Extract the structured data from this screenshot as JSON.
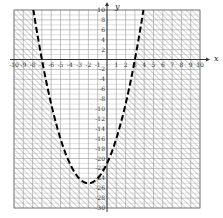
{
  "chart_data": {
    "type": "line",
    "title": "",
    "xlabel": "x",
    "ylabel": "y",
    "xlim": [
      -10,
      10
    ],
    "ylim": [
      -30,
      10
    ],
    "x_step": 1,
    "y_step": 2,
    "grid": true,
    "x_tick_labels": [
      "-10",
      "-9",
      "-8",
      "-7",
      "-6",
      "-5",
      "-4",
      "-3",
      "-2",
      "-1",
      "1",
      "2",
      "3",
      "4",
      "5",
      "6",
      "7",
      "8",
      "9",
      "10"
    ],
    "y_tick_labels": [
      "10",
      "8",
      "6",
      "4",
      "2",
      "-2",
      "-4",
      "-6",
      "-8",
      "-10",
      "-12",
      "-14",
      "-16",
      "-18",
      "-20",
      "-22",
      "-24",
      "-26",
      "-28",
      "-30"
    ],
    "series": [
      {
        "name": "boundary",
        "equation": "y = x^2 + 4x - 21",
        "style": "dashed",
        "color": "#000000",
        "vertex": [
          -2,
          -25
        ],
        "roots": [
          -7,
          3
        ],
        "y_intercept": -21
      }
    ],
    "shaded_region": "outside parabola (y < x^2 + 4x - 21)",
    "shading_style": "diagonal hatch",
    "legend": null
  },
  "colors": {
    "grid": "#9a9a9a",
    "axis": "#333333",
    "hatch": "#8c8c8c",
    "curve": "#000000"
  }
}
